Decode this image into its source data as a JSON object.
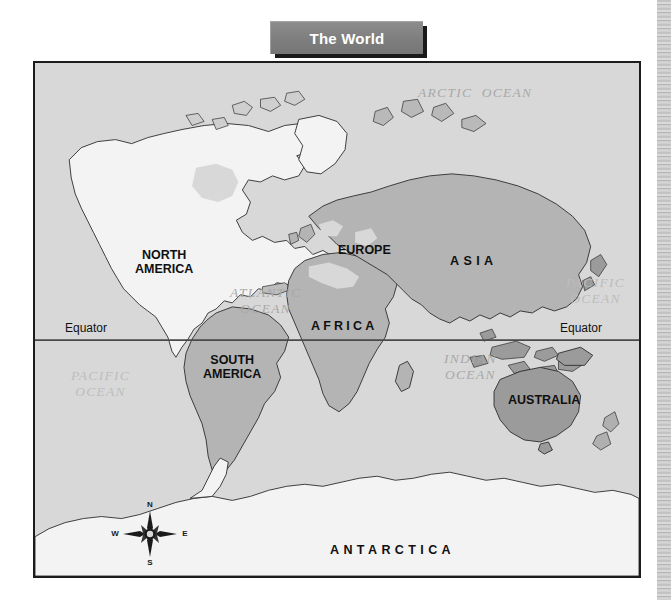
{
  "page": {
    "background_color": "#ffffff",
    "scan_edge_present": true
  },
  "title": {
    "text": "The World",
    "text_color": "#ffffff",
    "banner_color": "#808080",
    "shadow_color": "#1a1a1a"
  },
  "map": {
    "frame_border_color": "#1c1c1c",
    "ocean_color": "#d8d8d8",
    "land_light_color": "#f2f2f2",
    "land_mid_color": "#b5b5b5",
    "land_dark_color": "#9a9a9a",
    "coastline_color": "#2b2b2b",
    "equator_line_color": "#4a4a4a",
    "continents": [
      {
        "name": "NORTH\nAMERICA",
        "id": "north-america",
        "x": 100,
        "y": 185,
        "spacing": "normal"
      },
      {
        "name": "SOUTH\nAMERICA",
        "id": "south-america",
        "x": 168,
        "y": 290,
        "spacing": "normal"
      },
      {
        "name": "EUROPE",
        "id": "europe",
        "x": 303,
        "y": 180,
        "spacing": "normal"
      },
      {
        "name": "ASIA",
        "id": "asia",
        "x": 415,
        "y": 191,
        "spacing": "wider"
      },
      {
        "name": "AFRICA",
        "id": "africa",
        "x": 276,
        "y": 256,
        "spacing": "wide"
      },
      {
        "name": "AUSTRALIA",
        "id": "australia",
        "x": 473,
        "y": 330,
        "spacing": "normal"
      },
      {
        "name": "ANTARCTICA",
        "id": "antarctica",
        "x": 295,
        "y": 480,
        "spacing": "wider"
      }
    ],
    "oceans": [
      {
        "name": "ARCTIC  OCEAN",
        "id": "arctic-ocean",
        "x": 383,
        "y": 22,
        "faint": false
      },
      {
        "name": "ATLANTIC\nOCEAN",
        "id": "atlantic-ocean",
        "x": 195,
        "y": 222,
        "faint": false
      },
      {
        "name": "INDIAN\nOCEAN",
        "id": "indian-ocean",
        "x": 409,
        "y": 288,
        "faint": false
      },
      {
        "name": "PACIFIC\nOCEAN",
        "id": "pacific-ocean-west",
        "x": 36,
        "y": 305,
        "faint": true
      },
      {
        "name": "PACIFIC\nOCEAN",
        "id": "pacific-ocean-east",
        "x": 531,
        "y": 212,
        "faint": true
      }
    ],
    "equator": {
      "label_left": "Equator",
      "label_right": "Equator",
      "left_x": 30,
      "right_x": 525,
      "y": 266
    },
    "compass": {
      "north": "N",
      "east": "E",
      "south": "S",
      "west": "W"
    }
  }
}
